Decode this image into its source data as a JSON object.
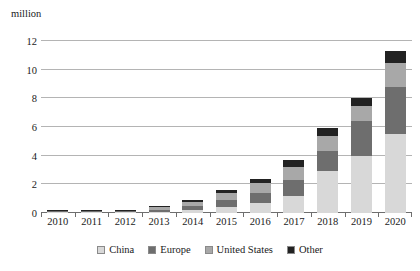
{
  "chart_data": {
    "type": "bar",
    "stacked": true,
    "title": "",
    "subtitle": "",
    "xlabel": "",
    "ylabel": "million",
    "unit_label": "million",
    "ylim": [
      0,
      12
    ],
    "ytick_values": [
      0,
      2,
      4,
      6,
      8,
      10,
      12
    ],
    "ytick_labels": [
      "0",
      "2",
      "4",
      "6",
      "8",
      "10",
      "12"
    ],
    "grid": true,
    "legend_position": "bottom",
    "categories": [
      "2010",
      "2011",
      "2012",
      "2013",
      "2014",
      "2015",
      "2016",
      "2017",
      "2018",
      "2019",
      "2020"
    ],
    "series": [
      {
        "name": "China",
        "color": "#d8d8d8",
        "values": [
          0.01,
          0.02,
          0.03,
          0.08,
          0.2,
          0.4,
          0.7,
          1.2,
          2.9,
          4.0,
          5.5
        ]
      },
      {
        "name": "Europe",
        "color": "#6e6e6e",
        "values": [
          0.01,
          0.03,
          0.05,
          0.15,
          0.3,
          0.5,
          0.7,
          1.1,
          1.4,
          2.4,
          3.3
        ]
      },
      {
        "name": "United States",
        "color": "#a8a8a8",
        "values": [
          0.01,
          0.02,
          0.05,
          0.2,
          0.3,
          0.5,
          0.7,
          0.9,
          1.1,
          1.1,
          1.7
        ]
      },
      {
        "name": "Other",
        "color": "#222222",
        "values": [
          0.01,
          0.03,
          0.05,
          0.07,
          0.1,
          0.2,
          0.3,
          0.5,
          0.5,
          0.5,
          0.8
        ]
      }
    ],
    "totals": [
      0.04,
      0.1,
      0.18,
      0.5,
      0.9,
      1.6,
      2.4,
      3.7,
      5.9,
      8.0,
      11.3
    ]
  },
  "legend": {
    "items": [
      {
        "label": "China",
        "color": "#d8d8d8"
      },
      {
        "label": "Europe",
        "color": "#6e6e6e"
      },
      {
        "label": "United States",
        "color": "#a8a8a8"
      },
      {
        "label": "Other",
        "color": "#222222"
      }
    ]
  }
}
